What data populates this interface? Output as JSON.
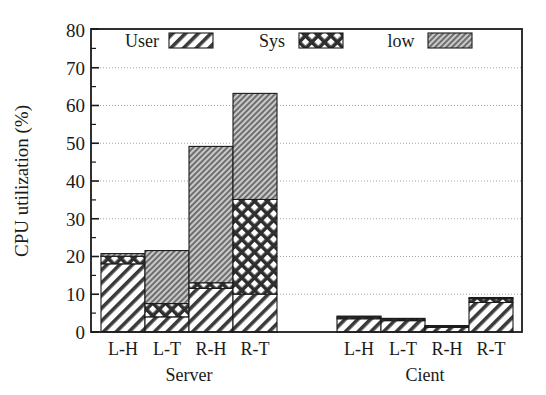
{
  "chart_data": {
    "type": "bar",
    "subtype": "stacked-bar-grouped",
    "title": "",
    "xlabel": "",
    "ylabel": "CPU utilization (%)",
    "ylim": [
      0,
      80
    ],
    "ytick_step": 10,
    "yticks": [
      "0",
      "10",
      "20",
      "30",
      "40",
      "50",
      "60",
      "70",
      "80"
    ],
    "minor_ticks": true,
    "grid": true,
    "grid_axis": "y",
    "legend_position": "top-inside",
    "legend": [
      "User",
      "Sys",
      "low"
    ],
    "series": [
      {
        "name": "User",
        "pattern": "diagonal-hatch",
        "values": [
          18.0,
          4.0,
          11.5,
          10.0,
          3.5,
          3.0,
          1.2,
          7.8
        ]
      },
      {
        "name": "Sys",
        "pattern": "cross-hatch",
        "values": [
          2.0,
          3.5,
          1.5,
          25.0,
          0.4,
          0.4,
          0.3,
          1.0
        ]
      },
      {
        "name": "low",
        "pattern": "fine-hatch-fill",
        "values": [
          0.7,
          14.0,
          36.0,
          28.0,
          0.3,
          0.2,
          0.2,
          0.3
        ]
      }
    ],
    "categories": [
      "L-H",
      "L-T",
      "R-H",
      "R-T",
      "L-H",
      "L-T",
      "R-H",
      "R-T"
    ],
    "groups": [
      {
        "label": "Server",
        "categories": [
          "L-H",
          "L-T",
          "R-H",
          "R-T"
        ],
        "totals": [
          20.7,
          21.5,
          49.0,
          63.0
        ]
      },
      {
        "label": "Cient",
        "categories": [
          "L-H",
          "L-T",
          "R-H",
          "R-T"
        ],
        "totals": [
          4.2,
          3.6,
          1.7,
          9.1
        ]
      }
    ],
    "colors": {
      "axis": "#1a1a1a",
      "grid": "#8a8a8a",
      "user_fill": "#ffffff",
      "sys_fill": "#5a5a5a",
      "low_fill": "#9a9a9a",
      "background": "#ffffff"
    }
  }
}
